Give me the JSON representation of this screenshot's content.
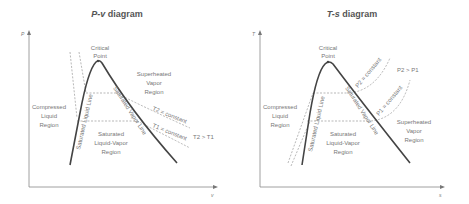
{
  "diagrams": [
    {
      "title": "P-v diagram",
      "title_italic": "P-v",
      "title_rest": " diagram",
      "y_axis": "P",
      "x_axis": "v",
      "labels": {
        "critical_1": "Critical",
        "critical_2": "Point",
        "superheated_1": "Superheated",
        "superheated_2": "Vapor",
        "superheated_3": "Region",
        "compressed_1": "Compressed",
        "compressed_2": "Liquid",
        "compressed_3": "Region",
        "saturated_1": "Saturated",
        "saturated_2": "Liquid-Vapor",
        "saturated_3": "Region",
        "sat_liquid_line": "Saturated Liquid Line",
        "sat_vapor_line": "Saturated Vapor Line",
        "iso_2": "T2 = constant",
        "iso_1": "T1 = constant",
        "relation": "T2 > T1"
      }
    },
    {
      "title": "T-s diagram",
      "title_italic": "T-s",
      "title_rest": " diagram",
      "y_axis": "T",
      "x_axis": "s",
      "labels": {
        "critical_1": "Critical",
        "critical_2": "Point",
        "superheated_1": "Superheated",
        "superheated_2": "Vapor",
        "superheated_3": "Region",
        "compressed_1": "Compressed",
        "compressed_2": "Liquid",
        "compressed_3": "Region",
        "saturated_1": "Saturated",
        "saturated_2": "Liquid-Vapor",
        "saturated_3": "Region",
        "sat_liquid_line": "Saturated Liquid Line",
        "sat_vapor_line": "Saturated Vapor Line",
        "iso_2": "P2 = constant",
        "iso_1": "P1 = constant",
        "relation": "P2 > P1"
      }
    }
  ],
  "colors": {
    "dome": "#444444",
    "axis": "#888888",
    "dashed": "#888888",
    "text": "#777777"
  }
}
